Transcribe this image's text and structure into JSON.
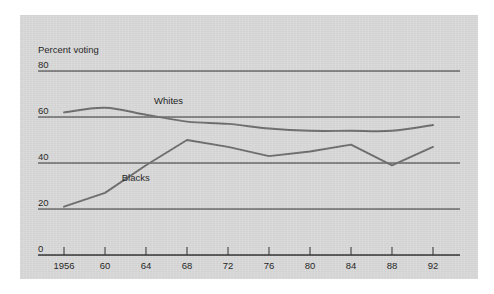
{
  "figure": {
    "background_color": "#ffffff",
    "plate_color": "#d9d9d9",
    "ink_color": "#2b2b2b"
  },
  "chart_data": {
    "type": "line",
    "title": "",
    "header_label": "Percent voting",
    "xlabel": "Year",
    "ylabel": "",
    "categories": [
      "1956",
      "60",
      "64",
      "68",
      "72",
      "76",
      "80",
      "84",
      "88",
      "92"
    ],
    "x": [
      1956,
      1960,
      1964,
      1968,
      1972,
      1976,
      1980,
      1984,
      1988,
      1992
    ],
    "xlim": [
      1956,
      1992
    ],
    "ylim": [
      0,
      80
    ],
    "yticks": [
      "0",
      "20",
      "40",
      "60",
      "80"
    ],
    "ytick_values": [
      0,
      20,
      40,
      60,
      80
    ],
    "grid": true,
    "grid_orientation": "horizontal",
    "legend": "inline-labels",
    "series": [
      {
        "name": "Whites",
        "color": "#6b6b6b",
        "smooth": true,
        "label_x": 1966.2,
        "label_y": 65.5,
        "values": [
          62,
          64,
          61,
          58,
          57,
          55,
          54,
          54,
          54,
          56.5
        ]
      },
      {
        "name": "Blacks",
        "color": "#6b6b6b",
        "smooth": false,
        "label_x": 1963.0,
        "label_y": 32.0,
        "values": [
          21,
          27,
          39,
          50,
          47,
          43,
          45,
          48,
          39,
          47
        ]
      }
    ]
  }
}
